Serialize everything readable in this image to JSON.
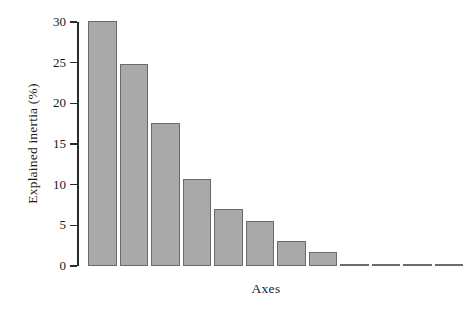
{
  "chart_data": {
    "type": "bar",
    "title": "",
    "subtitle": "",
    "xlabel": "Axes",
    "ylabel": "Explained inertia (%)",
    "categories": [
      "1",
      "2",
      "3",
      "4",
      "5",
      "6",
      "7",
      "8",
      "9",
      "10",
      "11",
      "12"
    ],
    "values": [
      30.1,
      24.8,
      17.6,
      10.7,
      7.0,
      5.5,
      3.1,
      1.7,
      0.15,
      0.15,
      0.15,
      0.15
    ],
    "ylim": [
      0,
      30
    ],
    "xlim": [
      0,
      12
    ],
    "ytick_labels": [
      "30",
      "25",
      "20",
      "15",
      "10",
      "5",
      "0"
    ],
    "ytick_values": [
      30,
      25,
      20,
      15,
      10,
      5,
      0
    ],
    "xtick_labels": [],
    "grid": false,
    "legend": false,
    "legend_position": "none",
    "annotations": [],
    "colors": {
      "bar_fill": "#a9a9a9",
      "bar_edge": "#6b6b6b",
      "axis": "#2b2b2b",
      "text": "#1a1a1a",
      "background": "#ffffff"
    }
  }
}
